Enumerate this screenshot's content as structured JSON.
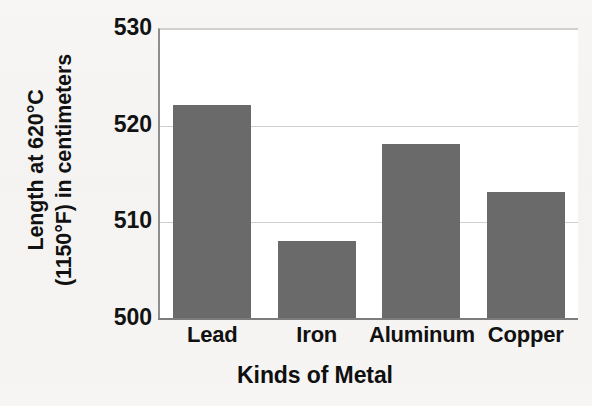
{
  "chart_data": {
    "type": "bar",
    "title": "",
    "title_cropped": true,
    "categories": [
      "Lead",
      "Iron",
      "Aluminum",
      "Copper"
    ],
    "values": [
      522,
      508,
      518,
      513
    ],
    "xlabel": "Kinds of Metal",
    "ylabel_line1": "Length at 620°C",
    "ylabel_line2": "(1150°F) in centimeters",
    "ylabel": "Length at 620°C (1150°F) in centimeters",
    "ylim": [
      500,
      530
    ],
    "yticks": [
      "530",
      "520",
      "510",
      "500"
    ],
    "ytick_values": [
      530,
      520,
      510,
      500
    ],
    "grid": true,
    "legend": false,
    "bar_color": "#6a6a6a",
    "plot_background": "#ffffff",
    "page_background": "#f6f5f3",
    "axis_color": "#7c7c7c",
    "gridline_color": "#cfcfcf",
    "text_color": "#111111"
  }
}
